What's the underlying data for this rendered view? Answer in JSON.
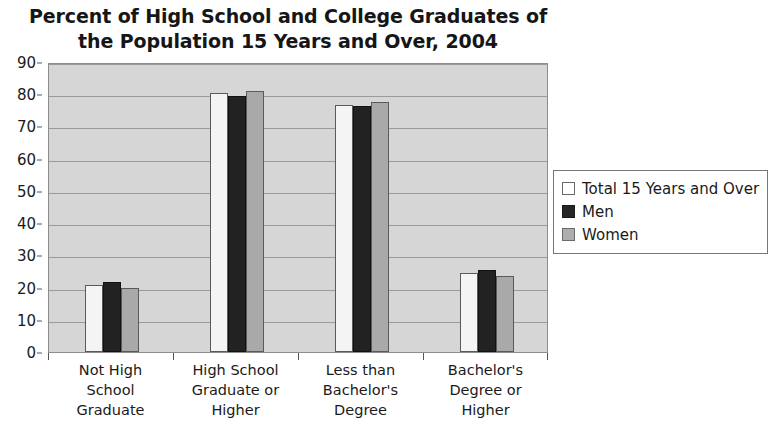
{
  "chart_data": {
    "type": "bar",
    "title": "Percent of High School and College Graduates of the Population 15 Years and Over, 2004",
    "title_line1": "Percent of High School and College Graduates of",
    "title_line2": "the Population 15 Years and Over, 2004",
    "xlabel": "",
    "ylabel": "",
    "ylim": [
      0,
      90
    ],
    "ytick_step": 10,
    "yticks": [
      0,
      10,
      20,
      30,
      40,
      50,
      60,
      70,
      80,
      90
    ],
    "grid": true,
    "legend_position": "right",
    "categories": [
      "Not High School Graduate",
      "High School Graduate or Higher",
      "Less than Bachelor's Degree",
      "Bachelor's Degree or Higher"
    ],
    "category_lines": [
      [
        "Not High",
        "School",
        "Graduate"
      ],
      [
        "High School",
        "Graduate or",
        "Higher"
      ],
      [
        "Less than",
        "Bachelor's",
        "Degree"
      ],
      [
        "Bachelor's",
        "Degree or",
        "Higher"
      ]
    ],
    "series": [
      {
        "name": "Total 15 Years and Over",
        "color": "#f4f4f4",
        "values": [
          20.7,
          80.3,
          76.8,
          24.5
        ]
      },
      {
        "name": "Men",
        "color": "#222222",
        "values": [
          21.7,
          79.5,
          76.2,
          25.4
        ]
      },
      {
        "name": "Women",
        "color": "#a9a9a9",
        "values": [
          20.0,
          81.0,
          77.7,
          23.6
        ]
      }
    ]
  },
  "legend": {
    "items": [
      {
        "label": "Total 15 Years and Over",
        "swatch": "white-square-icon"
      },
      {
        "label": "Men",
        "swatch": "black-square-icon"
      },
      {
        "label": "Women",
        "swatch": "gray-square-icon"
      }
    ]
  },
  "colors": {
    "plot_background": "#d6d6d6",
    "gridline": "#9a9a9a",
    "axis": "#555555",
    "text": "#1a1a1a",
    "series_total": "#f4f4f4",
    "series_men": "#222222",
    "series_women": "#a9a9a9"
  }
}
